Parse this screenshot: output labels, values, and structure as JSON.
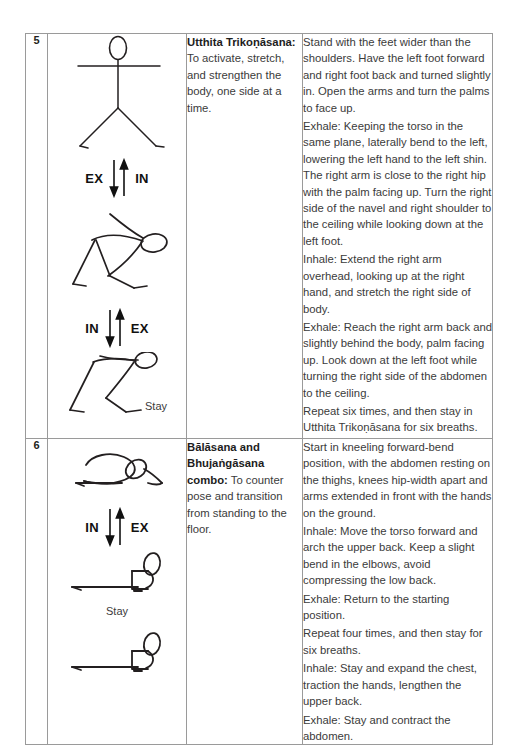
{
  "document": {
    "type": "yoga-practice-sequence-table",
    "background_color": "#ffffff",
    "border_color": "#9a9a9a",
    "text_color": "#3b3b3b"
  },
  "table": {
    "columns": [
      "number",
      "figure",
      "pose_name",
      "instructions"
    ],
    "rows": [
      {
        "number": "5",
        "pose": {
          "title": "Utthita Trikoṇāsana:",
          "purpose": " To activate, stretch, and strengthen the body, one side at a time."
        },
        "figures": [
          {
            "id": "standing-arms-out",
            "name": "standing-figure-arms-extended",
            "breath": {
              "left": "EX",
              "right": "IN"
            }
          },
          {
            "id": "triangle-pose-down",
            "name": "triangle-pose-figure",
            "breath": {
              "left": "IN",
              "right": "EX"
            }
          },
          {
            "id": "triangle-pose-stay",
            "name": "triangle-pose-stay-figure",
            "stay": "Stay"
          }
        ],
        "instructions": [
          "Stand with the feet wider than the shoulders. Have the left foot forward and right foot back and turned slightly in. Open the arms and turn the palms to face up.",
          "Exhale: Keeping the torso in the same plane, laterally bend to the left, lowering the left hand to the left shin. The right arm is close to the right hip with the palm facing up. Turn the right side of the navel and right shoulder to the ceiling while looking down at the left foot.",
          "Inhale: Extend the right arm overhead, looking up at the right hand, and stretch the right side of body.",
          "Exhale: Reach the right arm back and slightly behind the body, palm facing up. Look down at the left foot while turning the right side of the abdomen to the ceiling.",
          "Repeat six times, and then stay in Utthita Trikoṇāsana for six breaths."
        ]
      },
      {
        "number": "6",
        "pose": {
          "title": "Bālāsana and Bhujaṅgāsana combo:",
          "purpose": " To counter pose and transition from standing to the floor."
        },
        "figures": [
          {
            "id": "kneeling-forward-bend",
            "name": "kneeling-forward-bend-figure",
            "breath": {
              "left": "IN",
              "right": "EX"
            }
          },
          {
            "id": "cobra-pose-stay",
            "name": "cobra-pose-figure",
            "stay": "Stay"
          },
          {
            "id": "cobra-pose-final",
            "name": "cobra-pose-final-figure"
          }
        ],
        "instructions": [
          "Start in kneeling forward-bend position, with the abdomen resting on the thighs, knees hip-width apart and arms extended in front with the hands on the ground.",
          "Inhale: Move the torso forward and arch the upper back. Keep a slight bend in the elbows, avoid compressing the low back.",
          "Exhale: Return to the starting position.",
          "Repeat four times, and then stay for six breaths.",
          "Inhale: Stay and expand the chest, traction the hands, lengthen the upper back.",
          "Exhale: Stay and contract the abdomen."
        ]
      }
    ]
  }
}
